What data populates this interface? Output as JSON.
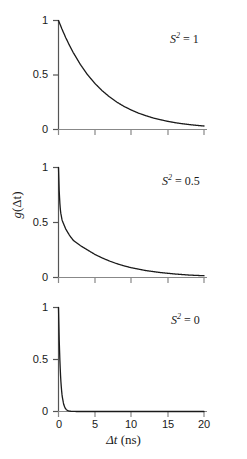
{
  "figure": {
    "axis_titles": {
      "x": "Δt (ns)",
      "x_symbol": "Δt",
      "x_units": "(ns)",
      "y": "g(Δt)",
      "y_function": "g",
      "y_argument": "(Δt)"
    },
    "line_color": "#1a1a1a",
    "axis_color": "#555555",
    "background": "#ffffff"
  },
  "chart_data": [
    {
      "type": "line",
      "title": "",
      "annotation": "S² = 1",
      "annotation_symbol": "S",
      "annotation_exponent": "2",
      "annotation_value": "1",
      "xlabel": "Δt (ns)",
      "ylabel": "g(Δt)",
      "xlim": [
        0,
        20
      ],
      "ylim": [
        0,
        1
      ],
      "xticks": [
        0,
        5,
        10,
        15,
        20
      ],
      "xticklabels": [
        "0",
        "5",
        "10",
        "15",
        "20"
      ],
      "yticks": [
        0,
        0.5,
        1
      ],
      "yticklabels": [
        "0",
        "0.5",
        "1"
      ],
      "grid": false,
      "legend": "none",
      "order_parameter": 1,
      "model": "g(t) = S2 + (1-S2)*exp(-t/tau_fast), slow decay exp(-t/tau_m)",
      "tau_slow_ns": 5.8,
      "tau_fast_ns": 0.25,
      "x": [
        0,
        0.5,
        1,
        1.5,
        2,
        3,
        4,
        5,
        6,
        7,
        8,
        9,
        10,
        11,
        12,
        13,
        14,
        15,
        16,
        17,
        18,
        19,
        20
      ],
      "values": [
        1.0,
        0.918,
        0.842,
        0.773,
        0.709,
        0.597,
        0.502,
        0.423,
        0.356,
        0.3,
        0.252,
        0.212,
        0.179,
        0.15,
        0.127,
        0.106,
        0.09,
        0.075,
        0.063,
        0.053,
        0.045,
        0.038,
        0.032
      ]
    },
    {
      "type": "line",
      "title": "",
      "annotation": "S² = 0.5",
      "annotation_symbol": "S",
      "annotation_exponent": "2",
      "annotation_value": "0.5",
      "xlabel": "Δt (ns)",
      "ylabel": "g(Δt)",
      "xlim": [
        0,
        20
      ],
      "ylim": [
        0,
        1
      ],
      "xticks": [
        0,
        5,
        10,
        15,
        20
      ],
      "xticklabels": [
        "0",
        "5",
        "10",
        "15",
        "20"
      ],
      "yticks": [
        0,
        0.5,
        1
      ],
      "yticklabels": [
        "0",
        "0.5",
        "1"
      ],
      "grid": false,
      "legend": "none",
      "order_parameter": 0.5,
      "model": "g(t) = [S2 + (1-S2)*exp(-t/tau_fast)] * exp(-t/tau_m)",
      "tau_slow_ns": 5.8,
      "tau_fast_ns": 0.18,
      "x": [
        0,
        0.1,
        0.2,
        0.3,
        0.5,
        0.75,
        1,
        1.5,
        2,
        3,
        4,
        5,
        6,
        7,
        8,
        9,
        10,
        12,
        14,
        16,
        18,
        20
      ],
      "values": [
        1.0,
        0.78,
        0.66,
        0.59,
        0.52,
        0.48,
        0.44,
        0.385,
        0.34,
        0.29,
        0.25,
        0.21,
        0.178,
        0.15,
        0.126,
        0.106,
        0.089,
        0.063,
        0.045,
        0.032,
        0.022,
        0.016
      ]
    },
    {
      "type": "line",
      "title": "",
      "annotation": "S² = 0",
      "annotation_symbol": "S",
      "annotation_exponent": "2",
      "annotation_value": "0",
      "xlabel": "Δt (ns)",
      "ylabel": "g(Δt)",
      "xlim": [
        0,
        20
      ],
      "ylim": [
        0,
        1
      ],
      "xticks": [
        0,
        5,
        10,
        15,
        20
      ],
      "xticklabels": [
        "0",
        "5",
        "10",
        "15",
        "20"
      ],
      "yticks": [
        0,
        0.5,
        1
      ],
      "yticklabels": [
        "0",
        "0.5",
        "1"
      ],
      "grid": false,
      "legend": "none",
      "order_parameter": 0,
      "model": "g(t) = exp(-t/tau_fast) * exp(-t/tau_m)",
      "tau_slow_ns": 5.8,
      "tau_fast_ns": 0.26,
      "x": [
        0,
        0.1,
        0.2,
        0.3,
        0.4,
        0.5,
        0.7,
        0.9,
        1.1,
        1.3,
        1.5,
        1.8,
        2.1,
        2.5,
        3,
        4,
        5,
        7,
        10,
        15,
        20
      ],
      "values": [
        1.0,
        0.68,
        0.47,
        0.32,
        0.22,
        0.15,
        0.072,
        0.034,
        0.016,
        0.0078,
        0.0037,
        0.0013,
        0.00045,
        0.00012,
        3e-05,
        0.0,
        0.0,
        0.0,
        0.0,
        0.0,
        0.0
      ]
    }
  ]
}
